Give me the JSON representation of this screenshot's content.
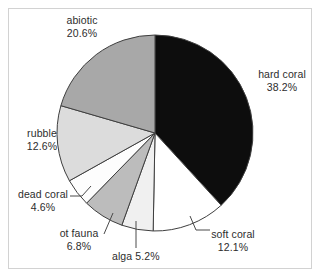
{
  "chart_data": {
    "type": "pie",
    "title": "",
    "subtitle": "",
    "xlabel": "",
    "ylabel": "",
    "legend_position": "none",
    "labels_position": "outside-with-leader-lines",
    "start_angle_deg": 0,
    "direction": "clockwise",
    "units": "percent",
    "total": 100.0,
    "categories": [
      "hard coral",
      "soft coral",
      "alga",
      "ot fauna",
      "dead coral",
      "rubble",
      "abiotic"
    ],
    "values": [
      38.2,
      12.1,
      5.2,
      6.8,
      4.6,
      12.6,
      20.6
    ],
    "slices": [
      {
        "name": "hard coral",
        "label": "hard coral",
        "value": 38.2,
        "value_text": "38.2%",
        "color": "#0d0d0d",
        "stroke": "#3f3f3f",
        "start_pct": 0.0,
        "end_pct": 38.2
      },
      {
        "name": "soft coral",
        "label": "soft coral",
        "value": 12.1,
        "value_text": "12.1%",
        "color": "#ffffff",
        "stroke": "#3f3f3f",
        "start_pct": 38.2,
        "end_pct": 50.3
      },
      {
        "name": "alga",
        "label": "alga",
        "value": 5.2,
        "value_text": "5.2%",
        "color": "#f0f0f0",
        "stroke": "#3f3f3f",
        "start_pct": 50.3,
        "end_pct": 55.5
      },
      {
        "name": "ot fauna",
        "label": "ot fauna",
        "value": 6.8,
        "value_text": "6.8%",
        "color": "#bcbcbc",
        "stroke": "#3f3f3f",
        "start_pct": 55.5,
        "end_pct": 62.3
      },
      {
        "name": "dead coral",
        "label": "dead coral",
        "value": 4.6,
        "value_text": "4.6%",
        "color": "#fdfdfd",
        "stroke": "#3f3f3f",
        "start_pct": 62.3,
        "end_pct": 66.9
      },
      {
        "name": "rubble",
        "label": "rubble",
        "value": 12.6,
        "value_text": "12.6%",
        "color": "#dcdcdc",
        "stroke": "#3f3f3f",
        "start_pct": 66.9,
        "end_pct": 79.5
      },
      {
        "name": "abiotic",
        "label": "abiotic",
        "value": 20.6,
        "value_text": "20.6%",
        "color": "#a8a8a8",
        "stroke": "#3f3f3f",
        "start_pct": 79.5,
        "end_pct": 100.0
      }
    ]
  },
  "labels": {
    "abiotic": {
      "name": "abiotic",
      "pct": "20.6%"
    },
    "hard_coral": {
      "name": "hard coral",
      "pct": "38.2%"
    },
    "rubble": {
      "name": "rubble",
      "pct": "12.6%"
    },
    "dead_coral": {
      "name": "dead coral",
      "pct": "4.6%"
    },
    "ot_fauna": {
      "name": "ot fauna",
      "pct": "6.8%"
    },
    "alga": {
      "name": "alga 5.2%"
    },
    "soft_coral": {
      "name": "soft coral",
      "pct": "12.1%"
    }
  },
  "style": {
    "background": "#ffffff",
    "frame_color": "#d2d2d2",
    "text_color": "#2d2d2d",
    "leader_color": "#4a4a4a"
  }
}
